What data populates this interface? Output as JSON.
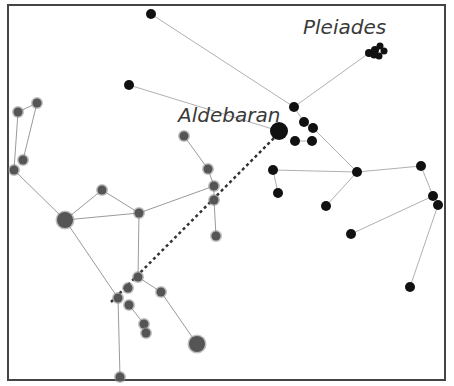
{
  "diagram": {
    "labels": [
      {
        "text": "Aldebaran",
        "x": 178,
        "y": 122,
        "size": 20
      },
      {
        "text": "Pleiades",
        "x": 303,
        "y": 34,
        "size": 20
      }
    ],
    "frame": {
      "x": 8,
      "y": 5,
      "width": 437,
      "height": 375,
      "color": "#444444"
    },
    "colors": {
      "taurus_star": "#111111",
      "orion_star": "#555555",
      "line": "#aaaaaa",
      "pointer": "#333333"
    },
    "pointer_line": {
      "from": [
        111,
        302
      ],
      "to": [
        276,
        136
      ],
      "style": "dotted",
      "meaning": "Orion's belt points to Aldebaran"
    },
    "taurus_stars": [
      {
        "id": "t1",
        "x": 151,
        "y": 14,
        "r": 5
      },
      {
        "id": "t2",
        "x": 129,
        "y": 85,
        "r": 5
      },
      {
        "id": "ain",
        "x": 294,
        "y": 107,
        "r": 5
      },
      {
        "id": "aldebaran",
        "x": 279,
        "y": 131,
        "r": 9
      },
      {
        "id": "h1",
        "x": 304,
        "y": 122,
        "r": 5
      },
      {
        "id": "h2",
        "x": 313,
        "y": 128,
        "r": 5
      },
      {
        "id": "h3",
        "x": 295,
        "y": 141,
        "r": 5
      },
      {
        "id": "h4",
        "x": 312,
        "y": 141,
        "r": 5
      },
      {
        "id": "p1",
        "x": 369,
        "y": 53,
        "r": 4
      },
      {
        "id": "p2",
        "x": 375,
        "y": 50,
        "r": 4
      },
      {
        "id": "p3",
        "x": 380,
        "y": 46,
        "r": 3.5
      },
      {
        "id": "p4",
        "x": 384,
        "y": 51,
        "r": 3.5
      },
      {
        "id": "p5",
        "x": 379,
        "y": 56,
        "r": 3.5
      },
      {
        "id": "p6",
        "x": 374,
        "y": 55,
        "r": 3.5
      },
      {
        "id": "c1",
        "x": 357,
        "y": 172,
        "r": 5
      },
      {
        "id": "c2",
        "x": 273,
        "y": 170,
        "r": 5
      },
      {
        "id": "c3",
        "x": 278,
        "y": 193,
        "r": 5
      },
      {
        "id": "c4",
        "x": 326,
        "y": 206,
        "r": 5
      },
      {
        "id": "c5",
        "x": 421,
        "y": 166,
        "r": 5
      },
      {
        "id": "c6",
        "x": 433,
        "y": 196,
        "r": 5
      },
      {
        "id": "c7",
        "x": 438,
        "y": 205,
        "r": 5
      },
      {
        "id": "c8",
        "x": 351,
        "y": 234,
        "r": 5
      },
      {
        "id": "c9",
        "x": 410,
        "y": 287,
        "r": 5
      }
    ],
    "taurus_lines": [
      [
        "t1",
        "ain"
      ],
      [
        "t2",
        "aldebaran"
      ],
      [
        "ain",
        "p1"
      ],
      [
        "ain",
        "h1"
      ],
      [
        "h1",
        "h2"
      ],
      [
        "h3",
        "h4"
      ],
      [
        "h2",
        "c1"
      ],
      [
        "c1",
        "c2"
      ],
      [
        "c2",
        "c3"
      ],
      [
        "c1",
        "c4"
      ],
      [
        "c1",
        "c5"
      ],
      [
        "c5",
        "c6"
      ],
      [
        "c6",
        "c8"
      ],
      [
        "c7",
        "c9"
      ]
    ],
    "orion_stars": [
      {
        "id": "o1",
        "x": 37,
        "y": 103,
        "r": 4.5
      },
      {
        "id": "o2",
        "x": 18,
        "y": 112,
        "r": 4.5
      },
      {
        "id": "o3",
        "x": 23,
        "y": 160,
        "r": 4.5
      },
      {
        "id": "o4",
        "x": 14,
        "y": 170,
        "r": 4.5
      },
      {
        "id": "betelgeuse",
        "x": 65,
        "y": 220,
        "r": 8
      },
      {
        "id": "o5",
        "x": 102,
        "y": 190,
        "r": 4.5
      },
      {
        "id": "o6",
        "x": 139,
        "y": 213,
        "r": 4.5
      },
      {
        "id": "o7",
        "x": 184,
        "y": 136,
        "r": 4.5
      },
      {
        "id": "o8",
        "x": 208,
        "y": 169,
        "r": 4.5
      },
      {
        "id": "o9",
        "x": 214,
        "y": 186,
        "r": 4.5
      },
      {
        "id": "o10",
        "x": 214,
        "y": 200,
        "r": 4.5
      },
      {
        "id": "o11",
        "x": 216,
        "y": 236,
        "r": 4.5
      },
      {
        "id": "belt1",
        "x": 118,
        "y": 298,
        "r": 4.5
      },
      {
        "id": "belt2",
        "x": 128,
        "y": 288,
        "r": 4.5
      },
      {
        "id": "belt3",
        "x": 138,
        "y": 277,
        "r": 4.5
      },
      {
        "id": "o12",
        "x": 161,
        "y": 292,
        "r": 4.5
      },
      {
        "id": "o13",
        "x": 129,
        "y": 305,
        "r": 4.5
      },
      {
        "id": "o14",
        "x": 144,
        "y": 324,
        "r": 4.5
      },
      {
        "id": "o15",
        "x": 146,
        "y": 333,
        "r": 4.5
      },
      {
        "id": "rigel",
        "x": 197,
        "y": 344,
        "r": 8
      },
      {
        "id": "o16",
        "x": 120,
        "y": 377,
        "r": 4.5
      }
    ],
    "orion_lines": [
      [
        "o1",
        "o2"
      ],
      [
        "o2",
        "o4"
      ],
      [
        "o1",
        "o3"
      ],
      [
        "o4",
        "betelgeuse"
      ],
      [
        "betelgeuse",
        "o5"
      ],
      [
        "betelgeuse",
        "o6"
      ],
      [
        "o5",
        "o6"
      ],
      [
        "o6",
        "o9"
      ],
      [
        "o7",
        "o8"
      ],
      [
        "o8",
        "o9"
      ],
      [
        "o9",
        "o10"
      ],
      [
        "o10",
        "o11"
      ],
      [
        "betelgeuse",
        "belt1"
      ],
      [
        "o6",
        "belt3"
      ],
      [
        "belt1",
        "o16"
      ],
      [
        "belt3",
        "o12"
      ],
      [
        "o12",
        "rigel"
      ],
      [
        "o13",
        "o14"
      ],
      [
        "o14",
        "o15"
      ]
    ]
  }
}
